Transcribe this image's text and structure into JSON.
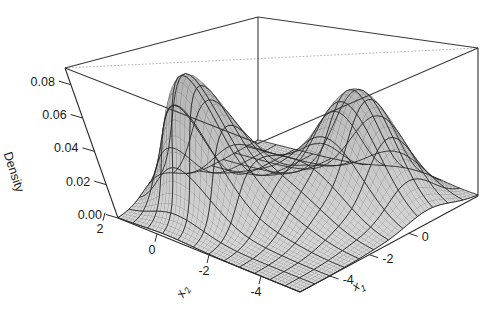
{
  "figure": {
    "kind": "surface-plot-3d",
    "background_color": "#ffffff",
    "line_color": "#2b2b2b",
    "mesh_color": "#4a4a4a",
    "hidden_edge_color": "#9a9a9a"
  },
  "axes": {
    "z": {
      "title": "Density",
      "ticks": [
        "0.08",
        "0.06",
        "0.04",
        "0.02",
        "0.00"
      ]
    },
    "x1": {
      "title": "x",
      "subscript": "1",
      "ticks": [
        "-4",
        "-2",
        "0"
      ]
    },
    "x2": {
      "title": "x",
      "subscript": "2",
      "ticks": [
        "2",
        "0",
        "-2",
        "-4"
      ]
    }
  },
  "chart_data": {
    "type": "surface",
    "title": "",
    "xlabel": "x1",
    "ylabel": "x2",
    "zlabel": "Density",
    "grid": false,
    "legend": "none",
    "xlim": [
      -5.5,
      1.5
    ],
    "ylim": [
      -5.5,
      3.5
    ],
    "zlim": [
      0.0,
      0.09
    ],
    "ztick_values": [
      0.0,
      0.02,
      0.04,
      0.06,
      0.08
    ],
    "xtick_values": [
      -4,
      -2,
      0
    ],
    "ytick_values": [
      2,
      0,
      -2,
      -4
    ],
    "components": [
      {
        "name": "mode-1",
        "center_x1": -3.6,
        "center_x2": -2.6,
        "sigma_x1": 0.95,
        "sigma_x2": 1.05,
        "peak_density": 0.082,
        "weight": 0.4
      },
      {
        "name": "mode-2",
        "center_x1": -0.6,
        "center_x2": 1.1,
        "sigma_x1": 1.0,
        "sigma_x2": 1.1,
        "peak_density": 0.068,
        "weight": 0.34
      },
      {
        "name": "mode-3",
        "center_x1": -1.6,
        "center_x2": -1.2,
        "sigma_x1": 1.25,
        "sigma_x2": 1.3,
        "peak_density": 0.027,
        "weight": 0.26
      }
    ],
    "contour_levels": [
      0.01,
      0.02,
      0.03,
      0.04,
      0.05,
      0.06,
      0.07
    ],
    "mesh_resolution": {
      "nx": 48,
      "ny": 48
    },
    "view": {
      "azimuth_deg": 34,
      "elevation_deg": 24
    }
  }
}
